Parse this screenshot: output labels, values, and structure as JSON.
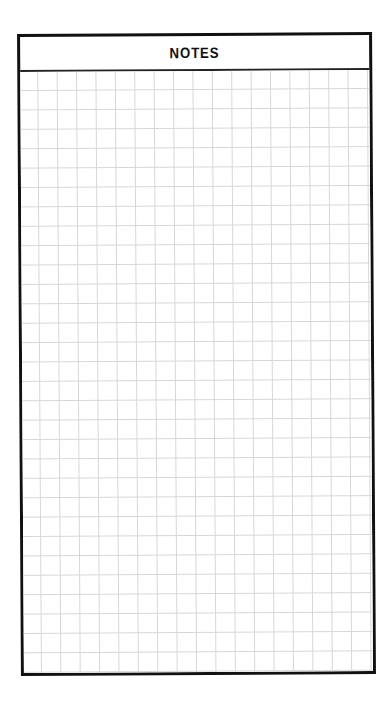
{
  "notes_page": {
    "title": "NOTES",
    "layout": "grid-paper",
    "colors": {
      "border": "#111111",
      "grid_line": "#d6d6d6",
      "background": "#ffffff"
    }
  }
}
